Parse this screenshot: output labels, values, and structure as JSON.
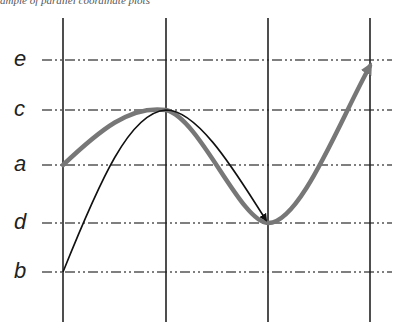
{
  "caption": "ample of parallel coordinate plots",
  "axis_labels": [
    "e",
    "c",
    "a",
    "d",
    "b"
  ],
  "levels": {
    "e": 60,
    "c": 110,
    "a": 165,
    "d": 223,
    "b": 272
  },
  "axes_count": 4,
  "colors": {
    "thick_path": "#777777",
    "thin_path": "#111111",
    "grid": "#555555",
    "axis": "#222222"
  },
  "paths": [
    {
      "name": "thick-gray-path",
      "sequence": [
        "a",
        "c",
        "d",
        "e"
      ]
    },
    {
      "name": "thin-black-path",
      "sequence": [
        "b",
        "c",
        "d"
      ]
    }
  ]
}
